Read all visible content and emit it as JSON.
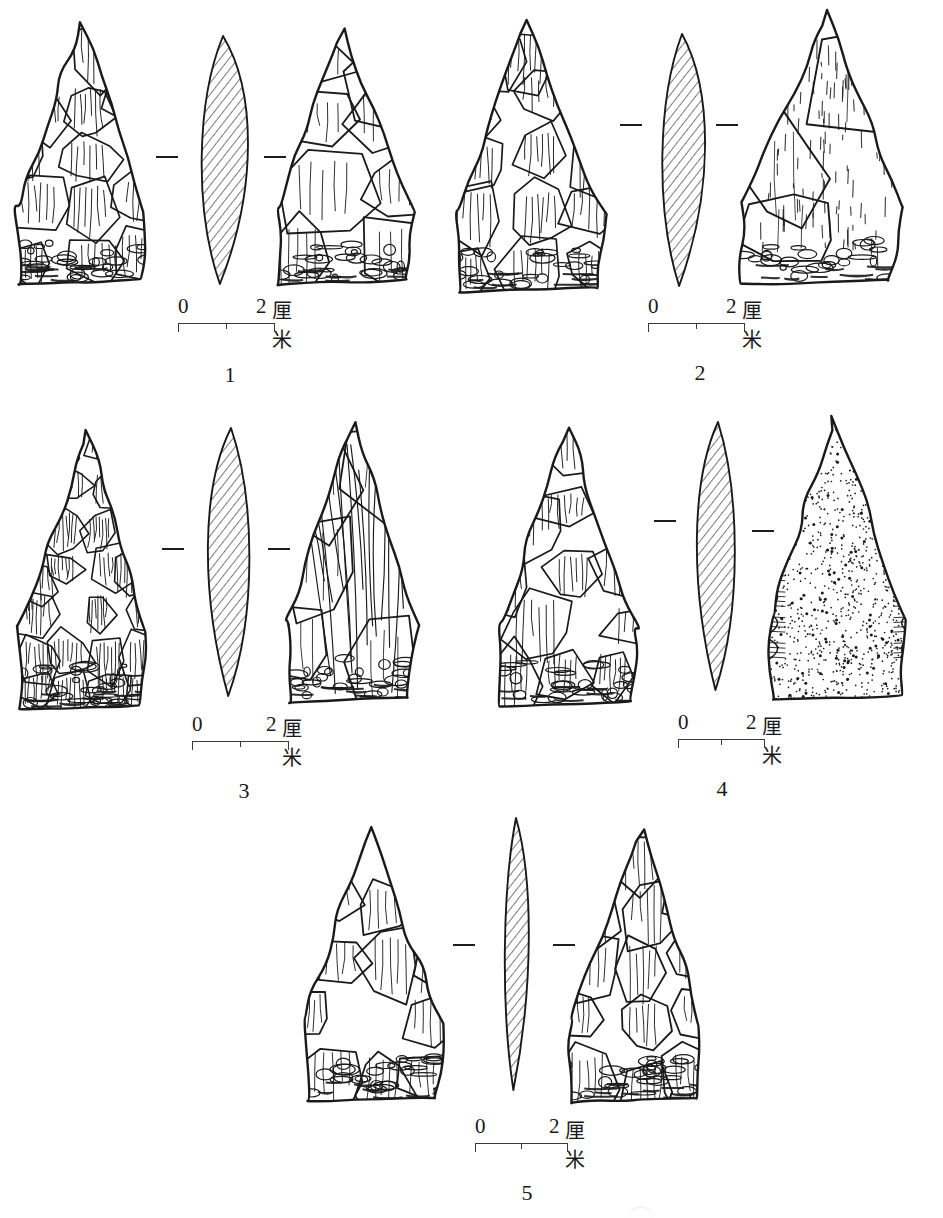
{
  "figure": {
    "kind": "archaeological-line-drawing-plate",
    "background_color": "#ffffff",
    "ink_color": "#1a1a1a",
    "scale_text": {
      "zero": "0",
      "two": "2",
      "unit": "厘米"
    }
  },
  "specimens": [
    {
      "number": "1",
      "left": 8,
      "top": 22,
      "width": 420,
      "height": 268,
      "views": [
        {
          "role": "obverse",
          "x": 0,
          "y": 0,
          "w": 150,
          "h": 262,
          "style": "flaked",
          "seed": 11,
          "outline": "teardrop"
        },
        {
          "role": "section",
          "x": 176,
          "y": 14,
          "w": 78,
          "h": 248,
          "style": "hatched",
          "seed": 12,
          "outline": "lens-left"
        },
        {
          "role": "reverse",
          "x": 260,
          "y": 8,
          "w": 158,
          "h": 254,
          "style": "flaked-sparse",
          "seed": 13,
          "outline": "teardrop"
        }
      ],
      "section_marks": [
        {
          "x": 148,
          "y": 134
        },
        {
          "x": 256,
          "y": 134
        }
      ],
      "scale": {
        "x": 170,
        "y": 272,
        "bar_width": 96,
        "label_two_x": 78
      },
      "fignum": {
        "x": 172,
        "y": 340,
        "w": 100
      }
    },
    {
      "number": "2",
      "left": 448,
      "top": 12,
      "width": 470,
      "height": 282,
      "views": [
        {
          "role": "obverse",
          "x": 0,
          "y": 8,
          "w": 170,
          "h": 272,
          "style": "flaked",
          "seed": 21,
          "outline": "shouldered"
        },
        {
          "role": "section",
          "x": 198,
          "y": 22,
          "w": 72,
          "h": 252,
          "style": "hatched",
          "seed": 22,
          "outline": "lens-left"
        },
        {
          "role": "reverse",
          "x": 282,
          "y": 0,
          "w": 182,
          "h": 272,
          "style": "smooth-dashed",
          "seed": 23,
          "outline": "broad"
        }
      ],
      "section_marks": [
        {
          "x": 172,
          "y": 112
        },
        {
          "x": 268,
          "y": 112
        }
      ],
      "scale": {
        "x": 200,
        "y": 282,
        "bar_width": 96,
        "label_two_x": 78
      },
      "fignum": {
        "x": 202,
        "y": 348,
        "w": 100
      }
    },
    {
      "number": "3",
      "left": 10,
      "top": 424,
      "width": 420,
      "height": 288,
      "views": [
        {
          "role": "obverse",
          "x": 0,
          "y": 6,
          "w": 148,
          "h": 280,
          "style": "flaked-dense",
          "seed": 31,
          "outline": "narrow-point"
        },
        {
          "role": "section",
          "x": 186,
          "y": 4,
          "w": 70,
          "h": 268,
          "style": "hatched",
          "seed": 32,
          "outline": "lens-right"
        },
        {
          "role": "reverse",
          "x": 268,
          "y": 0,
          "w": 150,
          "h": 278,
          "style": "flaked-long",
          "seed": 33,
          "outline": "narrow-point"
        }
      ],
      "section_marks": [
        {
          "x": 152,
          "y": 124
        },
        {
          "x": 258,
          "y": 124
        }
      ],
      "scale": {
        "x": 182,
        "y": 288,
        "bar_width": 96,
        "label_two_x": 74
      },
      "fignum": {
        "x": 184,
        "y": 354,
        "w": 100
      }
    },
    {
      "number": "4",
      "left": 490,
      "top": 418,
      "width": 430,
      "height": 292,
      "views": [
        {
          "role": "obverse",
          "x": 0,
          "y": 10,
          "w": 160,
          "h": 278,
          "style": "flaked",
          "seed": 41,
          "outline": "teardrop"
        },
        {
          "role": "section",
          "x": 196,
          "y": 4,
          "w": 64,
          "h": 268,
          "style": "hatched",
          "seed": 42,
          "outline": "lens-right"
        },
        {
          "role": "reverse",
          "x": 272,
          "y": 0,
          "w": 156,
          "h": 282,
          "style": "stippled",
          "seed": 43,
          "outline": "teardrop"
        }
      ],
      "section_marks": [
        {
          "x": 164,
          "y": 102
        },
        {
          "x": 262,
          "y": 112
        }
      ],
      "scale": {
        "x": 188,
        "y": 292,
        "bar_width": 86,
        "label_two_x": 68
      },
      "fignum": {
        "x": 182,
        "y": 358,
        "w": 100
      }
    },
    {
      "number": "5",
      "left": 295,
      "top": 818,
      "width": 400,
      "height": 290,
      "views": [
        {
          "role": "obverse",
          "x": 0,
          "y": 4,
          "w": 160,
          "h": 280,
          "style": "flaked-broad",
          "seed": 51,
          "outline": "round-top"
        },
        {
          "role": "section",
          "x": 188,
          "y": 0,
          "w": 66,
          "h": 272,
          "style": "hatched",
          "seed": 52,
          "outline": "lens-narrow"
        },
        {
          "role": "reverse",
          "x": 266,
          "y": 4,
          "w": 152,
          "h": 280,
          "style": "flaked-broad",
          "seed": 53,
          "outline": "round-top"
        }
      ],
      "section_marks": [
        {
          "x": 158,
          "y": 126
        },
        {
          "x": 258,
          "y": 126
        }
      ],
      "scale": {
        "x": 180,
        "y": 296,
        "bar_width": 92,
        "label_two_x": 74
      },
      "fignum": {
        "x": 182,
        "y": 362,
        "w": 100
      }
    }
  ]
}
